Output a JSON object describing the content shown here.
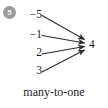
{
  "figure": {
    "badge": {
      "number": "5",
      "circle_color": "#9a9a9a",
      "text_color": "#ececec"
    },
    "caption": "many-to-one",
    "line_color": "#2b2b2b",
    "text_color": "#1b1b1b",
    "background_color": "#ffffff",
    "diagram": {
      "type": "mapping-diagram",
      "relation": "many-to-one",
      "sources": [
        {
          "label": "−5",
          "value": -5,
          "x": 42,
          "y": 15
        },
        {
          "label": "−1",
          "value": -1,
          "x": 42,
          "y": 35
        },
        {
          "label": "2",
          "value": 2,
          "x": 42,
          "y": 53
        },
        {
          "label": "3",
          "value": 3,
          "x": 42,
          "y": 71
        }
      ],
      "target": {
        "label": "4",
        "value": 4,
        "x": 85,
        "y": 45
      },
      "arrows": [
        {
          "from": "−5",
          "to": "4"
        },
        {
          "from": "−1",
          "to": "4"
        },
        {
          "from": "2",
          "to": "4"
        },
        {
          "from": "3",
          "to": "4"
        }
      ]
    }
  }
}
